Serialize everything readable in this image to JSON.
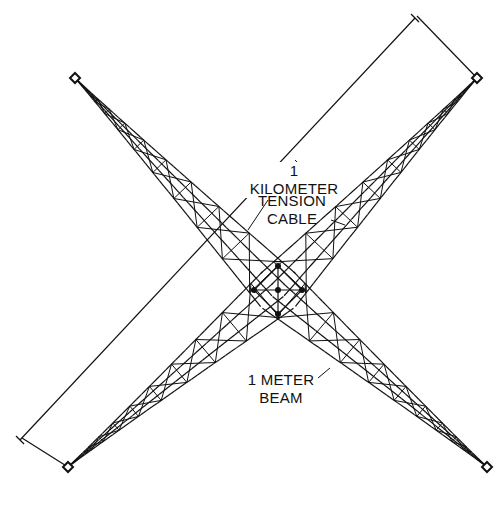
{
  "diagram": {
    "labels": {
      "length": "1 KILOMETER",
      "cable_line1": "TENSION",
      "cable_line2": "CABLE",
      "beam_line1": "1 METER",
      "beam_line2": "BEAM"
    },
    "colors": {
      "stroke": "#111111",
      "background": "#ffffff"
    },
    "endpoints": [
      {
        "name": "top-left",
        "x": 75,
        "y": 78
      },
      {
        "name": "top-right",
        "x": 477,
        "y": 78
      },
      {
        "name": "bottom-left",
        "x": 68,
        "y": 467
      },
      {
        "name": "bottom-right",
        "x": 487,
        "y": 467
      }
    ],
    "center": {
      "x": 278,
      "y": 290
    }
  }
}
